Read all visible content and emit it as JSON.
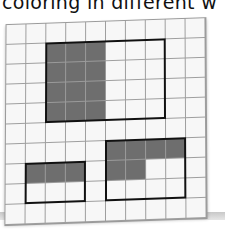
{
  "caption": "coloring in different w",
  "grid": {
    "columns": 10,
    "rows": 10,
    "cell_color": "#f7f7f7",
    "line_color": "#9e9e9e",
    "shade_color": "#6e6e6e",
    "outline_color": "#111111"
  },
  "rectangles": [
    {
      "name": "large-rectangle",
      "col": 2,
      "row": 1,
      "width": 6,
      "height": 4,
      "shaded": [
        [
          2,
          1
        ],
        [
          3,
          1
        ],
        [
          4,
          1
        ],
        [
          2,
          2
        ],
        [
          3,
          2
        ],
        [
          4,
          2
        ],
        [
          2,
          3
        ],
        [
          3,
          3
        ],
        [
          4,
          3
        ],
        [
          2,
          4
        ],
        [
          3,
          4
        ],
        [
          4,
          4
        ]
      ]
    },
    {
      "name": "small-left-rectangle",
      "col": 1,
      "row": 7,
      "width": 3,
      "height": 2,
      "shaded": [
        [
          1,
          7
        ],
        [
          2,
          7
        ],
        [
          3,
          7
        ]
      ]
    },
    {
      "name": "right-rectangle",
      "col": 5,
      "row": 6,
      "width": 4,
      "height": 3,
      "shaded": [
        [
          5,
          6
        ],
        [
          6,
          6
        ],
        [
          7,
          6
        ],
        [
          8,
          6
        ],
        [
          5,
          7
        ],
        [
          6,
          7
        ]
      ]
    }
  ]
}
